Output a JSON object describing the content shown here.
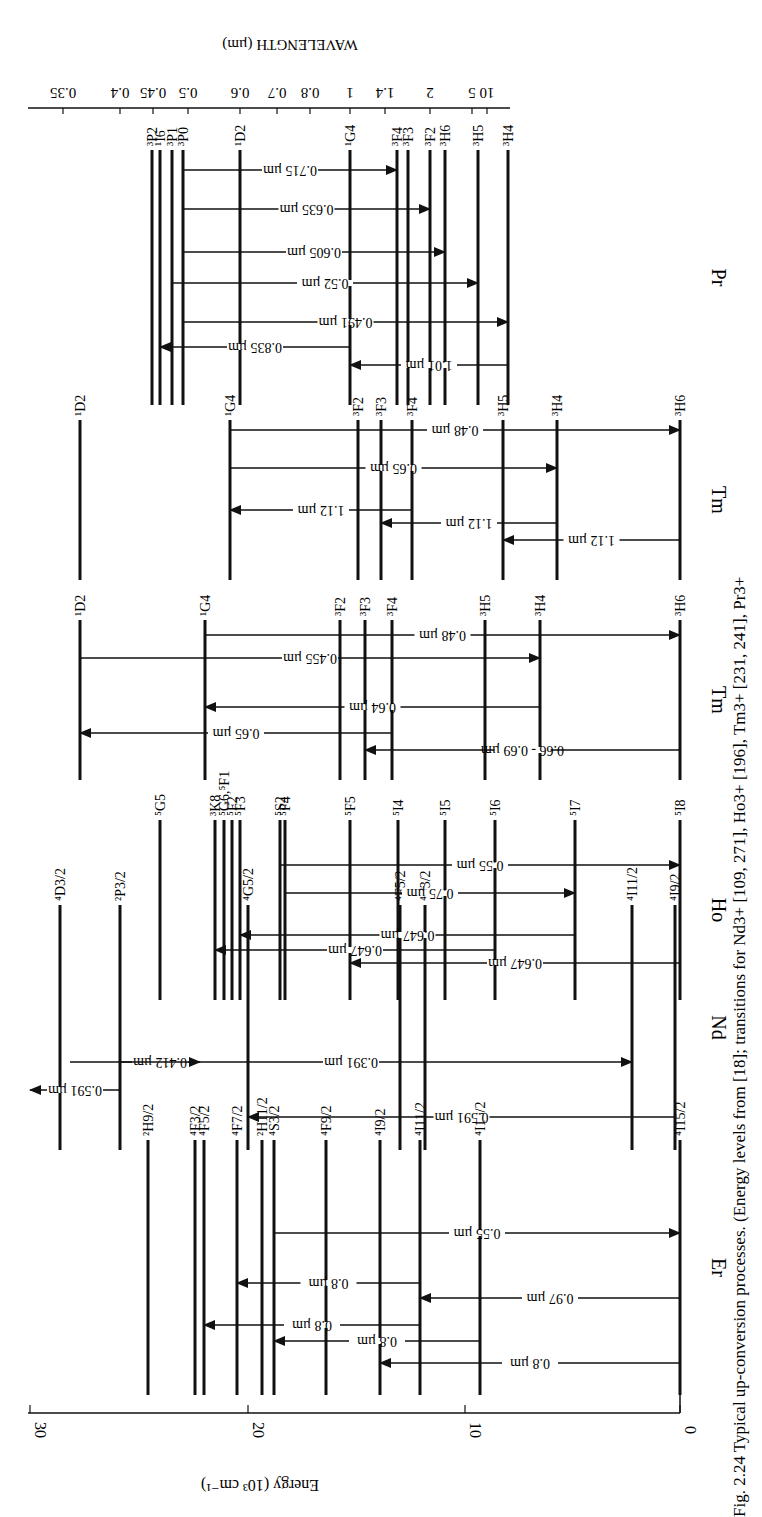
{
  "figure": {
    "caption": "Fig. 2.24 Typical up-conversion processes. (Energy levels from [18]; transitions for Nd3+ [109, 271], Ho3+ [196], Tm3+ [231, 241], Pr3+",
    "energy_axis": {
      "label": "Energy (10³ cm⁻¹)",
      "ticks": [
        {
          "v": 30,
          "x": 30
        },
        {
          "v": 20,
          "x": 248
        },
        {
          "v": 10,
          "x": 465
        },
        {
          "v": 0,
          "x": 680
        }
      ]
    },
    "wavelength_axis": {
      "label": "WAVELENGTH (µm)",
      "ticks": [
        {
          "v": "0.35",
          "x": 63
        },
        {
          "v": "0.4",
          "x": 120
        },
        {
          "v": "0.45",
          "x": 153
        },
        {
          "v": "0.5",
          "x": 188
        },
        {
          "v": "0.6",
          "x": 240
        },
        {
          "v": "0.7",
          "x": 277
        },
        {
          "v": "0.8",
          "x": 310
        },
        {
          "v": "1",
          "x": 350
        },
        {
          "v": "1.4",
          "x": 385
        },
        {
          "v": "2",
          "x": 430
        },
        {
          "v": "5",
          "x": 472
        },
        {
          "v": "10",
          "x": 487
        }
      ]
    },
    "ions": [
      {
        "name": "Er",
        "y0": 1140,
        "y1": 1395,
        "levels": [
          {
            "label": "²H9/2",
            "x": 148
          },
          {
            "label": "⁴F3/2",
            "x": 195
          },
          {
            "label": "⁴F5/2",
            "x": 204
          },
          {
            "label": "⁴F7/2",
            "x": 237
          },
          {
            "label": "²H11/2",
            "x": 262
          },
          {
            "label": "⁴S3/2",
            "x": 274
          },
          {
            "label": "⁴F9/2",
            "x": 326
          },
          {
            "label": "⁴I9/2",
            "x": 380
          },
          {
            "label": "⁴I11/2",
            "x": 420
          },
          {
            "label": "⁴I13/2",
            "x": 480
          },
          {
            "label": "⁴I15/2",
            "x": 680
          }
        ],
        "transitions": [
          {
            "label": "0.55 µm",
            "from": 274,
            "to": 680,
            "y": 1233
          },
          {
            "label": "0.8 µm",
            "from": 420,
            "to": 237,
            "y": 1283
          },
          {
            "label": "0.97 µm",
            "from": 680,
            "to": 420,
            "y": 1298
          },
          {
            "label": "0.8 µm",
            "from": 420,
            "to": 204,
            "y": 1325
          },
          {
            "label": "0.8 µm",
            "from": 480,
            "to": 274,
            "y": 1341
          },
          {
            "label": "0.8 µm",
            "from": 680,
            "to": 380,
            "y": 1363
          }
        ]
      },
      {
        "name": "Nd",
        "y0": 905,
        "y1": 1150,
        "levels": [
          {
            "label": "⁴D3/2",
            "x": 60
          },
          {
            "label": "²P3/2",
            "x": 120
          },
          {
            "label": "⁴G5/2",
            "x": 248
          },
          {
            "label": "⁴F5/2",
            "x": 400
          },
          {
            "label": "⁴F3/2",
            "x": 425
          },
          {
            "label": "⁴I11/2",
            "x": 632
          },
          {
            "label": "⁴I9/2",
            "x": 675
          }
        ],
        "transitions": [
          {
            "label": "0.412 µm",
            "from": 120,
            "to": 200,
            "y": 1062
          },
          {
            "label": "0.391 µm",
            "from": 70,
            "to": 632,
            "y": 1062
          },
          {
            "label": "0.591 µm",
            "from": 120,
            "to": 30,
            "y": 1090
          },
          {
            "label": "0.591 µm",
            "from": 675,
            "to": 248,
            "y": 1117
          }
        ]
      },
      {
        "name": "Ho",
        "y0": 820,
        "y1": 1000,
        "levels": [
          {
            "label": "⁵G5",
            "x": 160
          },
          {
            "label": "³K8",
            "x": 215
          },
          {
            "label": "⁵G6,⁵F1",
            "x": 224
          },
          {
            "label": "⁵F2",
            "x": 232
          },
          {
            "label": "⁵F3",
            "x": 240
          },
          {
            "label": "⁵S2",
            "x": 280
          },
          {
            "label": "⁵F4",
            "x": 285
          },
          {
            "label": "⁵F5",
            "x": 350
          },
          {
            "label": "⁵I4",
            "x": 398
          },
          {
            "label": "⁵I5",
            "x": 445
          },
          {
            "label": "⁵I6",
            "x": 495
          },
          {
            "label": "⁵I7",
            "x": 575
          },
          {
            "label": "⁵I8",
            "x": 680
          }
        ],
        "transitions": [
          {
            "label": "0.55 µm",
            "from": 280,
            "to": 680,
            "y": 865
          },
          {
            "label": "0.75 µm",
            "from": 285,
            "to": 575,
            "y": 893
          },
          {
            "label": "0.647 µm",
            "from": 575,
            "to": 240,
            "y": 935
          },
          {
            "label": "0.647 µm",
            "from": 495,
            "to": 215,
            "y": 950
          },
          {
            "label": "0.647 µm",
            "from": 680,
            "to": 350,
            "y": 963
          }
        ]
      },
      {
        "name": "Tm",
        "y0": 620,
        "y1": 780,
        "levels": [
          {
            "label": "¹D2",
            "x": 80
          },
          {
            "label": "¹G4",
            "x": 205
          },
          {
            "label": "³F2",
            "x": 340
          },
          {
            "label": "³F3",
            "x": 365
          },
          {
            "label": "³F4",
            "x": 392
          },
          {
            "label": "³H5",
            "x": 485
          },
          {
            "label": "³H4",
            "x": 540
          },
          {
            "label": "³H6",
            "x": 680
          }
        ],
        "transitions": [
          {
            "label": "0.48 µm",
            "from": 205,
            "to": 680,
            "y": 635
          },
          {
            "label": "0.455 µm",
            "from": 80,
            "to": 540,
            "y": 658
          },
          {
            "label": "0.64 µm",
            "from": 540,
            "to": 205,
            "y": 707
          },
          {
            "label": "0.65 µm",
            "from": 392,
            "to": 80,
            "y": 733
          },
          {
            "label": "0.66 - 0.69 µm",
            "from": 680,
            "to": 365,
            "y": 750
          }
        ]
      },
      {
        "name": "Tm",
        "y0": 420,
        "y1": 580,
        "levels": [
          {
            "label": "¹D2",
            "x": 80
          },
          {
            "label": "¹G4",
            "x": 230
          },
          {
            "label": "³F2",
            "x": 358
          },
          {
            "label": "³F3",
            "x": 381
          },
          {
            "label": "³F4",
            "x": 412
          },
          {
            "label": "³H5",
            "x": 503
          },
          {
            "label": "³H4",
            "x": 557
          },
          {
            "label": "³H6",
            "x": 680
          }
        ],
        "transitions": [
          {
            "label": "0.48 µm",
            "from": 230,
            "to": 680,
            "y": 430
          },
          {
            "label": "0.65 µm",
            "from": 230,
            "to": 557,
            "y": 468
          },
          {
            "label": "1.12 µm",
            "from": 412,
            "to": 230,
            "y": 510
          },
          {
            "label": "1.12 µm",
            "from": 557,
            "to": 381,
            "y": 523
          },
          {
            "label": "1.12 µm",
            "from": 680,
            "to": 503,
            "y": 540
          }
        ]
      },
      {
        "name": "Pr",
        "y0": 150,
        "y1": 405,
        "levels": [
          {
            "label": "³P2",
            "x": 152
          },
          {
            "label": "¹I6",
            "x": 160
          },
          {
            "label": "³P1",
            "x": 172
          },
          {
            "label": "³P0",
            "x": 183
          },
          {
            "label": "¹D2",
            "x": 240
          },
          {
            "label": "¹G4",
            "x": 350
          },
          {
            "label": "³F4",
            "x": 397
          },
          {
            "label": "³F3",
            "x": 408
          },
          {
            "label": "³F2",
            "x": 430
          },
          {
            "label": "³H6",
            "x": 445
          },
          {
            "label": "³H5",
            "x": 478
          },
          {
            "label": "³H4",
            "x": 508
          }
        ],
        "transitions": [
          {
            "label": "0.715 µm",
            "from": 183,
            "to": 397,
            "y": 170
          },
          {
            "label": "0.635 µm",
            "from": 183,
            "to": 430,
            "y": 209
          },
          {
            "label": "0.605 µm",
            "from": 183,
            "to": 445,
            "y": 252
          },
          {
            "label": "0.52 µm",
            "from": 172,
            "to": 478,
            "y": 283
          },
          {
            "label": "0.491 µm",
            "from": 183,
            "to": 508,
            "y": 322
          },
          {
            "label": "0.835 µm",
            "from": 350,
            "to": 160,
            "y": 347
          },
          {
            "label": "1.01 µm",
            "from": 508,
            "to": 350,
            "y": 365
          }
        ]
      }
    ]
  }
}
